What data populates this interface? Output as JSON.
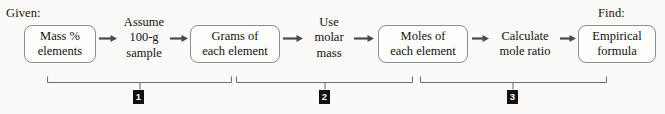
{
  "diagram": {
    "captions": [
      {
        "name": "given-caption",
        "text": "Given:",
        "x": 6,
        "y": 6
      },
      {
        "name": "find-caption",
        "text": "Find:",
        "x": 598,
        "y": 6
      }
    ],
    "boxes": [
      {
        "name": "box-mass-percent-elements",
        "lines": [
          "Mass %",
          "elements"
        ],
        "x": 24,
        "y": 25,
        "w": 72,
        "h": 38
      },
      {
        "name": "box-grams-each-element",
        "lines": [
          "Grams of",
          "each element"
        ],
        "x": 190,
        "y": 25,
        "w": 90,
        "h": 38
      },
      {
        "name": "box-moles-each-element",
        "lines": [
          "Moles of",
          "each element"
        ],
        "x": 378,
        "y": 25,
        "w": 90,
        "h": 38
      },
      {
        "name": "box-empirical-formula",
        "lines": [
          "Empirical",
          "formula"
        ],
        "x": 578,
        "y": 25,
        "w": 78,
        "h": 38
      }
    ],
    "steps": [
      {
        "name": "step-assume-100g-sample",
        "lines": [
          "Assume",
          "100-g",
          "sample"
        ],
        "x": 119,
        "y": 15,
        "w": 50
      },
      {
        "name": "step-use-molar-mass",
        "lines": [
          "Use",
          "molar",
          "mass"
        ],
        "x": 307,
        "y": 15,
        "w": 44
      },
      {
        "name": "step-calculate-mole-ratio",
        "lines": [
          "Calculate",
          "mole ratio"
        ],
        "x": 492,
        "y": 29,
        "w": 66
      }
    ],
    "arrows": [
      {
        "name": "arrow-1",
        "x": 99,
        "y": 38,
        "len": 18
      },
      {
        "name": "arrow-2",
        "x": 170,
        "y": 38,
        "len": 18
      },
      {
        "name": "arrow-3",
        "x": 283,
        "y": 38,
        "len": 20
      },
      {
        "name": "arrow-4",
        "x": 354,
        "y": 38,
        "len": 20
      },
      {
        "name": "arrow-5",
        "x": 472,
        "y": 38,
        "len": 17
      },
      {
        "name": "arrow-6",
        "x": 560,
        "y": 38,
        "len": 16
      }
    ],
    "brackets": [
      {
        "name": "bracket-1",
        "label": "1",
        "x": 47,
        "y": 76,
        "w": 185,
        "tick_x": 93,
        "marker_x": 133
      },
      {
        "name": "bracket-2",
        "label": "2",
        "x": 236,
        "y": 76,
        "w": 177,
        "tick_x": 89,
        "marker_x": 319
      },
      {
        "name": "bracket-3",
        "label": "3",
        "x": 420,
        "y": 76,
        "w": 187,
        "tick_x": 93,
        "marker_x": 507
      }
    ],
    "colors": {
      "background": "#fbfaf8",
      "box_border": "#8c8c8c",
      "arrow": "#4a4a4a",
      "bracket": "#6f6f6f",
      "marker_bg": "#111111",
      "marker_fg": "#ffffff",
      "text": "#111111"
    }
  }
}
